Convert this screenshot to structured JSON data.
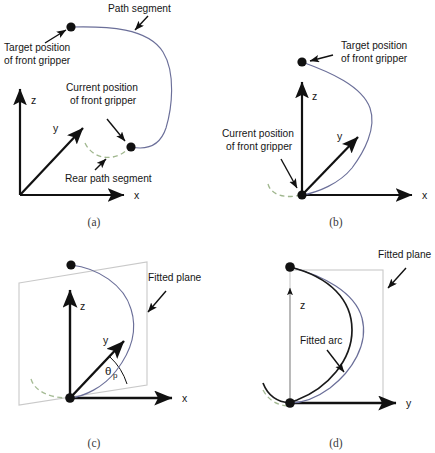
{
  "figure": {
    "type": "technical-diagram",
    "background_color": "#ffffff",
    "colors": {
      "path_curve": "#6b6f99",
      "fitted_arc": "#1a1a1a",
      "rear_path_dashed": "#8faa7a",
      "axis": "#111111",
      "plane_outline": "#c9c9c9",
      "thin_axis": "#9a9a9a",
      "text": "#161616",
      "caption": "#3a3a3a"
    },
    "panels": [
      {
        "id": "a",
        "caption": "(a)",
        "axes": [
          "x",
          "y",
          "z"
        ],
        "labels": [
          "Path segment",
          "Target position of front gripper",
          "Current position of front gripper",
          "Rear path segment"
        ]
      },
      {
        "id": "b",
        "caption": "(b)",
        "axes": [
          "x",
          "y",
          "z"
        ],
        "labels": [
          "Target position of front gripper",
          "Current position of front gripper"
        ]
      },
      {
        "id": "c",
        "caption": "(c)",
        "axes": [
          "x",
          "y",
          "z"
        ],
        "labels": [
          "Fitted plane"
        ],
        "angle_symbol": "θ",
        "angle_subscript": "p"
      },
      {
        "id": "d",
        "caption": "(d)",
        "axes": [
          "y",
          "z"
        ],
        "labels": [
          "Fitted plane",
          "Fitted arc"
        ]
      }
    ]
  },
  "panel_a": {
    "caption": "(a)",
    "path_segment_label": "Path segment",
    "target_label_line1": "Target position",
    "target_label_line2": "of front gripper",
    "current_label_line1": "Current position",
    "current_label_line2": "of front gripper",
    "rear_label": "Rear path segment",
    "axis_x": "x",
    "axis_y": "y",
    "axis_z": "z"
  },
  "panel_b": {
    "caption": "(b)",
    "target_label_line1": "Target position",
    "target_label_line2": "of front gripper",
    "current_label_line1": "Current position",
    "current_label_line2": "of front gripper",
    "axis_x": "x",
    "axis_y": "y",
    "axis_z": "z"
  },
  "panel_c": {
    "caption": "(c)",
    "fitted_plane_label": "Fitted plane",
    "theta_symbol": "θ",
    "theta_subscript": "p",
    "axis_x": "x",
    "axis_y": "y",
    "axis_z": "z"
  },
  "panel_d": {
    "caption": "(d)",
    "fitted_plane_label": "Fitted plane",
    "fitted_arc_label": "Fitted arc",
    "axis_y": "y",
    "axis_z": "z"
  }
}
